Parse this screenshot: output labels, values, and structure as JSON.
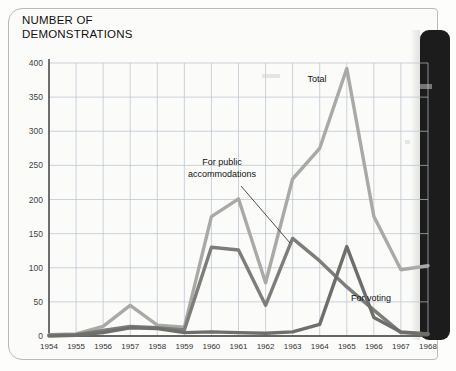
{
  "page": {
    "title_line1": "NUMBER OF",
    "title_line2": "DEMONSTRATIONS",
    "title": "NUMBER OF\nDEMONSTRATIONS"
  },
  "chart_data": {
    "type": "line",
    "title": "NUMBER OF DEMONSTRATIONS",
    "xlabel": "",
    "ylabel": "NUMBER OF DEMONSTRATIONS",
    "xlim": [
      1954,
      1968
    ],
    "ylim": [
      0,
      400
    ],
    "yticks": [
      0,
      50,
      100,
      150,
      200,
      250,
      300,
      350,
      400
    ],
    "grid": true,
    "legend": "inline-annotations",
    "categories": [
      1954,
      1955,
      1956,
      1957,
      1958,
      1959,
      1960,
      1961,
      1962,
      1963,
      1964,
      1965,
      1966,
      1967,
      1968
    ],
    "x": [
      "1954",
      "1955",
      "1956",
      "1957",
      "1958",
      "1959",
      "1960",
      "1961",
      "1962",
      "1963",
      "1964",
      "1965",
      "1966",
      "1967",
      "1968"
    ],
    "series": [
      {
        "name": "Total",
        "color": "#a9a9a6",
        "label": "Total",
        "values": [
          2,
          3,
          14,
          45,
          16,
          13,
          175,
          201,
          78,
          230,
          275,
          392,
          175,
          97,
          103
        ]
      },
      {
        "name": "For public accommodations",
        "color": "#7d7d7a",
        "label": "For public accommodations",
        "label_line1": "For public",
        "label_line2": "accommodations",
        "values": [
          1,
          2,
          8,
          14,
          12,
          9,
          130,
          126,
          45,
          143,
          110,
          72,
          38,
          5,
          3
        ]
      },
      {
        "name": "For voting",
        "color": "#6e6e6b",
        "label": "For voting",
        "values": [
          0,
          1,
          5,
          12,
          11,
          5,
          6,
          5,
          4,
          6,
          17,
          131,
          27,
          6,
          3
        ]
      }
    ],
    "annotations": [
      {
        "text": "Total",
        "series": "Total"
      },
      {
        "text": "For public accommodations",
        "series": "For public accommodations",
        "has_leader_line": true
      },
      {
        "text": "For voting",
        "series": "For voting"
      }
    ]
  }
}
